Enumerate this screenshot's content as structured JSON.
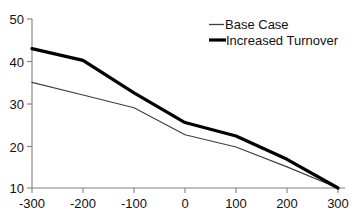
{
  "chart_data": {
    "type": "line",
    "title": "",
    "xlabel": "",
    "ylabel": "",
    "xlim": [
      -300,
      300
    ],
    "ylim": [
      10,
      50
    ],
    "x": [
      -300,
      -200,
      -100,
      0,
      100,
      200,
      300
    ],
    "xticks": [
      "-300",
      "-200",
      "-100",
      "0",
      "100",
      "200",
      "300"
    ],
    "yticks": [
      "10",
      "20",
      "30",
      "40",
      "50"
    ],
    "ytick_values": [
      10,
      20,
      30,
      40,
      50
    ],
    "grid": false,
    "legend_position": "top-right",
    "series": [
      {
        "name": "Base Case",
        "style": "thin",
        "color": "#3d3d3d",
        "values": [
          35,
          32,
          29,
          22.6,
          19.7,
          15,
          10
        ]
      },
      {
        "name": "Increased Turnover",
        "style": "thick",
        "color": "#000000",
        "values": [
          43,
          40.2,
          32.5,
          25.5,
          22.3,
          16.8,
          10
        ]
      }
    ]
  },
  "legend": {
    "entries": [
      {
        "label": "Base Case"
      },
      {
        "label": "Increased Turnover"
      }
    ]
  },
  "axes": {
    "y_tick_labels": [
      "50",
      "40",
      "30",
      "20",
      "10"
    ],
    "x_tick_labels": [
      "-300",
      "-200",
      "-100",
      "0",
      "100",
      "200",
      "300"
    ]
  }
}
